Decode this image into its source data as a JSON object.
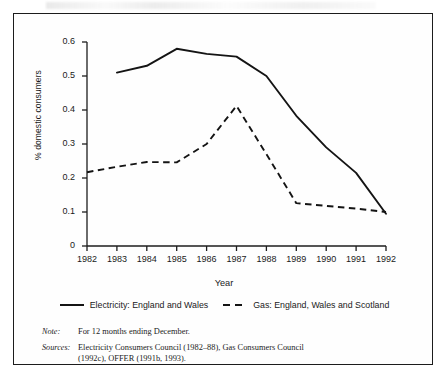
{
  "figure": {
    "frame_border_color": "#1c1c1c",
    "background": "#ffffff"
  },
  "chart_data": {
    "type": "line",
    "title": "",
    "xlabel": "Year",
    "ylabel": "% domestic consumers",
    "x": [
      1982,
      1983,
      1984,
      1985,
      1986,
      1987,
      1988,
      1989,
      1990,
      1991,
      1992
    ],
    "xtick_labels": [
      "1982",
      "1983",
      "1984",
      "1985",
      "1986",
      "1987",
      "1988",
      "1989",
      "1990",
      "1991",
      "1992"
    ],
    "ytick_labels": [
      "0",
      "0.1",
      "0.2",
      "0.3",
      "0.4",
      "0.5",
      "0.6"
    ],
    "ytick_values": [
      0,
      0.1,
      0.2,
      0.3,
      0.4,
      0.5,
      0.6
    ],
    "xlim": [
      1982,
      1992
    ],
    "ylim": [
      0,
      0.6
    ],
    "grid": false,
    "legend_position": "below-axes",
    "series": [
      {
        "name": "Electricity: England and Wales",
        "style": "solid",
        "color": "#141414",
        "x": [
          1983,
          1984,
          1985,
          1986,
          1987,
          1988,
          1989,
          1990,
          1991,
          1992
        ],
        "values": [
          0.51,
          0.53,
          0.58,
          0.565,
          0.557,
          0.5,
          0.383,
          0.29,
          0.215,
          0.095
        ]
      },
      {
        "name": "Gas: England, Wales and Scotland",
        "style": "dashed",
        "color": "#141414",
        "x": [
          1982,
          1983,
          1984,
          1985,
          1986,
          1987,
          1988,
          1989,
          1990,
          1991,
          1992
        ],
        "values": [
          0.217,
          0.233,
          0.247,
          0.246,
          0.3,
          0.412,
          0.27,
          0.126,
          0.118,
          0.11,
          0.1
        ]
      }
    ]
  },
  "legend": {
    "entries": [
      {
        "label": "Electricity: England and Wales",
        "style": "solid"
      },
      {
        "label": "Gas: England, Wales and Scotland",
        "style": "dashed"
      }
    ]
  },
  "footnotes": {
    "note": {
      "tag": "Note:",
      "text": "For 12 months ending December."
    },
    "sources": {
      "tag": "Sources:",
      "line1": "Electricity Consumers Council (1982–88), Gas Consumers Council",
      "line2": "(1992c), OFFER (1991b, 1993)."
    }
  }
}
